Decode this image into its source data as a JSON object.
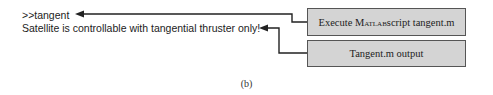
{
  "console": {
    "command": ">>tangent",
    "output": "Satellite is controllable with tangential thruster only!"
  },
  "callouts": [
    {
      "pre": "Execute ",
      "smallcaps": "Matlab",
      "post": " script tangent.m"
    },
    {
      "label": "Tangent.m output"
    }
  ],
  "caption": "(b)"
}
